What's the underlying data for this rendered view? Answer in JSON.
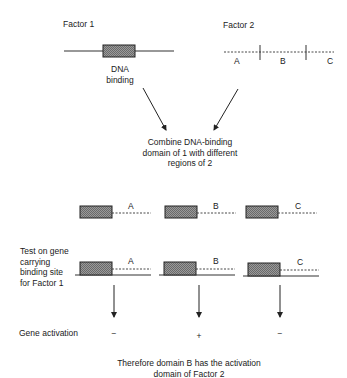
{
  "factor1": {
    "label": "Factor 1",
    "domain_label_line1": "DNA",
    "domain_label_line2": "binding"
  },
  "factor2": {
    "label": "Factor 2",
    "regions": [
      "A",
      "B",
      "C"
    ]
  },
  "combine": {
    "line1": "Combine DNA-binding",
    "line2": "domain of 1 with different",
    "line3": "regions of 2"
  },
  "hybrids": [
    {
      "region": "A"
    },
    {
      "region": "B"
    },
    {
      "region": "C"
    }
  ],
  "test": {
    "line1": "Test on gene",
    "line2": "carrying",
    "line3": "binding site",
    "line4": "for Factor 1",
    "bound": [
      {
        "region": "A"
      },
      {
        "region": "B"
      },
      {
        "region": "C"
      }
    ]
  },
  "activation": {
    "label": "Gene activation",
    "results": [
      "−",
      "+",
      "−"
    ]
  },
  "conclusion": {
    "line1": "Therefore domain B has the activation",
    "line2": "domain of Factor 2"
  },
  "colors": {
    "line": "#222222",
    "box_fill": "#8c8c8c"
  }
}
